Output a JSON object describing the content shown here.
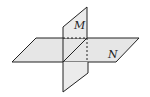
{
  "diagram": {
    "labels": {
      "plane_vertical": "M",
      "plane_horizontal": "N"
    },
    "colors": {
      "fill": "#e6e6e6",
      "stroke": "#222222",
      "background": "#ffffff"
    }
  }
}
